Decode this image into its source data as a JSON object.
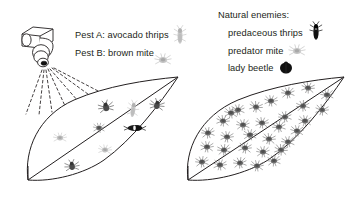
{
  "diagram": {
    "title_hidden": "",
    "left_panel": {
      "sprayer": {
        "icon": "spray-nozzle-icon",
        "spray_line_count": 7
      },
      "labels": {
        "pest_a": "Pest A: avocado thrips",
        "pest_b": "Pest B: brown mite"
      },
      "key_icons": [
        {
          "name": "avocado-thrips-icon",
          "tone": "light"
        },
        {
          "name": "brown-mite-icon",
          "tone": "light"
        }
      ],
      "leaf": {
        "name": "treated-leaf",
        "pest_count": 9,
        "description": "sprayed leaf with few pests"
      }
    },
    "right_panel": {
      "legend_title": "Natural enemies:",
      "legend_items": [
        {
          "label": "predaceous thrips",
          "icon": "predaceous-thrips-icon",
          "color": "#1a1a1a"
        },
        {
          "label": "predator mite",
          "icon": "predator-mite-icon",
          "color": "#8c8c8c"
        },
        {
          "label": "lady beetle",
          "icon": "lady-beetle-icon",
          "color": "#111111"
        }
      ],
      "leaf": {
        "name": "untreated-leaf",
        "pest_count": 31,
        "description": "untreated leaf heavily infested with mites"
      }
    },
    "colors": {
      "outline": "#231f20",
      "text": "#231f20",
      "pest_dark": "#595959",
      "pest_mid": "#7d7d7d",
      "pest_light": "#c8c8c8",
      "background": "#ffffff"
    }
  }
}
